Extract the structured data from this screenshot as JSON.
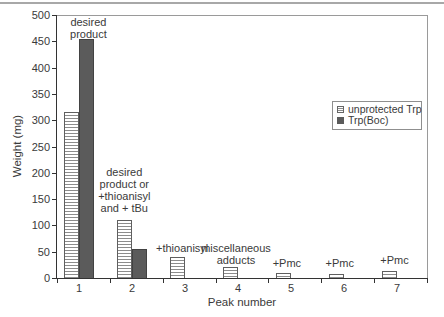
{
  "chart_data": {
    "type": "bar",
    "title": "",
    "xlabel": "Peak number",
    "ylabel": "Weight (mg)",
    "ylim": [
      0,
      500
    ],
    "ytick_step": 50,
    "yticks": [
      0,
      50,
      100,
      150,
      200,
      250,
      300,
      350,
      400,
      450,
      500
    ],
    "categories": [
      "1",
      "2",
      "3",
      "4",
      "5",
      "6",
      "7"
    ],
    "series": [
      {
        "name": "unprotected Trp",
        "style": "hatched",
        "values": [
          315,
          110,
          40,
          20,
          10,
          8,
          13
        ]
      },
      {
        "name": "Trp(Boc)",
        "style": "solid",
        "values": [
          455,
          55,
          0,
          0,
          0,
          0,
          0
        ]
      }
    ],
    "grid": false,
    "legend_position": "inside-right",
    "annotations": [
      {
        "peak": 1,
        "text": "desired\nproduct"
      },
      {
        "peak": 2,
        "text": "desired\nproduct or\n+thioanisyl\nand + tBu"
      },
      {
        "peak": 3,
        "text": "+thioanisyl"
      },
      {
        "peak": 4,
        "text": "miscellaneous\nadducts"
      },
      {
        "peak": 5,
        "text": "+Pmc"
      },
      {
        "peak": 6,
        "text": "+Pmc"
      },
      {
        "peak": 7,
        "text": "+Pmc"
      }
    ]
  },
  "colors": {
    "solid_bar": "#5b5b5b",
    "hatch_line": "#8c8c8c",
    "axis": "#333333",
    "frame": "#9a9a9a",
    "text": "#3a3a3a",
    "top_rule": "#a8a8a8"
  }
}
